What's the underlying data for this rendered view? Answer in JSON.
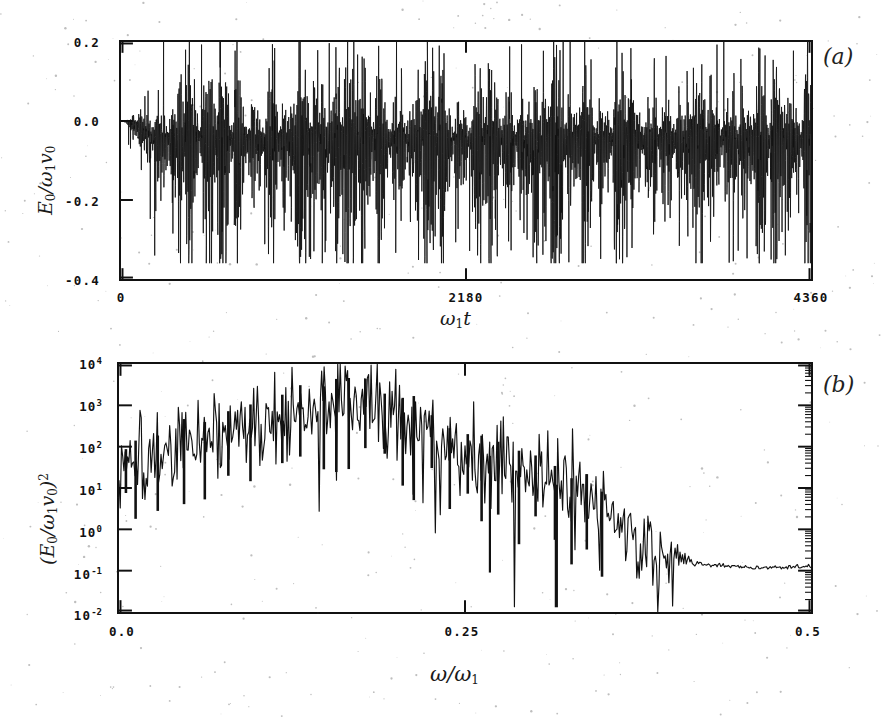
{
  "figure": {
    "panels": [
      {
        "tag": "(a)",
        "y_label": "E_0/ω_1 v_0",
        "x_label": "ω_1 t",
        "y_ticks": [
          "0.2",
          "0.0",
          "-0.2",
          "-0.4"
        ],
        "x_ticks": [
          "0",
          "2180",
          "4360"
        ]
      },
      {
        "tag": "(b)",
        "y_label": "(E_0/ω_1 v_0)^2",
        "x_label": "ω/ω_1",
        "y_ticks": [
          "10",
          "10",
          "10",
          "10",
          "10",
          "10",
          "10"
        ],
        "y_tick_exponents": [
          "4",
          "3",
          "2",
          "1",
          "0",
          "-1",
          "-2"
        ],
        "x_ticks": [
          "0.0",
          "0.25",
          "0.5"
        ]
      }
    ],
    "ink_color": "#111111",
    "background_color": "#ffffff"
  },
  "chart_data": [
    {
      "type": "line",
      "panel": "(a)",
      "title": "",
      "xlabel": "ω₁t",
      "ylabel": "E₀/ω₁v₀",
      "xlim": [
        0,
        4360
      ],
      "ylim": [
        -0.4,
        0.2
      ],
      "xticks": [
        0,
        2180,
        4360
      ],
      "yticks": [
        0.2,
        0.0,
        -0.2,
        -0.4
      ],
      "grid": false,
      "legend": "none",
      "description": "Chaotic electric-field time series. Signal starts at zero, grows over the first ~200 time units into a dense burst-like oscillation of roughly constant envelope thereafter. Spikes reach +0.20 at the top of the axis and -0.35 at the bottom; the bulk of the oscillation is concentrated between -0.12 and +0.03 with a mean slightly below zero. Bursts repeat quasi-periodically with a spacing of roughly 90-110 in ω₁t.",
      "envelope_top": 0.2,
      "envelope_bottom": -0.36,
      "burst_period": 100,
      "growth_end": 220,
      "mean_level": -0.045
    },
    {
      "type": "line",
      "panel": "(b)",
      "title": "",
      "xlabel": "ω/ω₁",
      "ylabel": "(E₀/ω₁v₀)²",
      "xlim": [
        0.0,
        0.5
      ],
      "ylim": [
        0.01,
        10000
      ],
      "yscale": "log",
      "xticks": [
        0.0,
        0.25,
        0.5
      ],
      "yticks": [
        0.01,
        0.1,
        1,
        10,
        100,
        1000,
        10000
      ],
      "grid": false,
      "legend": "none",
      "description": "Power spectrum of the panel (a) signal. Broadband noisy spectrum rising from ~30 at ω/ω₁=0, reaching a broad maximum of ~2000 near ω/ω₁≈0.16, then decaying roughly three decades to a smooth flat noise floor near 0.12 for ω/ω₁>0.40. Individual spectral spikes fluctuate over 1-2 decades about the mean envelope.",
      "x": [
        0.0,
        0.01,
        0.02,
        0.03,
        0.04,
        0.05,
        0.06,
        0.07,
        0.08,
        0.09,
        0.1,
        0.11,
        0.12,
        0.13,
        0.14,
        0.15,
        0.16,
        0.17,
        0.18,
        0.19,
        0.2,
        0.21,
        0.22,
        0.23,
        0.24,
        0.25,
        0.26,
        0.27,
        0.28,
        0.29,
        0.3,
        0.31,
        0.32,
        0.33,
        0.34,
        0.35,
        0.36,
        0.37,
        0.38,
        0.39,
        0.4,
        0.42,
        0.44,
        0.46,
        0.48,
        0.5
      ],
      "y": [
        30,
        40,
        55,
        70,
        90,
        120,
        160,
        200,
        230,
        280,
        330,
        400,
        500,
        650,
        900,
        1400,
        2000,
        1600,
        1100,
        900,
        700,
        420,
        260,
        150,
        90,
        55,
        40,
        32,
        28,
        25,
        20,
        14,
        9,
        6,
        4,
        2.5,
        1.6,
        1.0,
        0.6,
        0.35,
        0.22,
        0.15,
        0.13,
        0.12,
        0.12,
        0.13
      ],
      "envelope_peak_value": 2000,
      "envelope_peak_x": 0.16,
      "noise_floor": 0.12
    }
  ]
}
